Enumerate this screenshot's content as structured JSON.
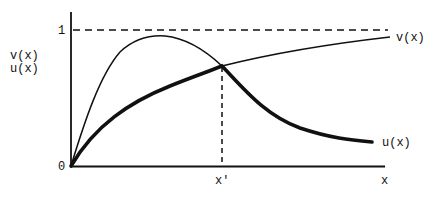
{
  "diagram": {
    "axes": {
      "y_label_top": "v(x)",
      "y_label_bottom": "u(x)",
      "y_tick_one": "1",
      "origin": "0",
      "x_label": "x",
      "x_marker": "x'"
    },
    "curves": {
      "v": {
        "label": "v(x)",
        "style": "thin"
      },
      "u": {
        "label": "u(x)",
        "style": "thick"
      }
    },
    "reference_line": {
      "value": "1",
      "style": "dashed"
    },
    "colors": {
      "ink": "#111111",
      "background": "#ffffff"
    }
  }
}
